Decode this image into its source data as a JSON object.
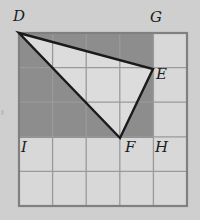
{
  "figure": {
    "background_color": "#cfcfcf",
    "grid": {
      "columns": 5,
      "rows": 5,
      "left": 19,
      "top": 33,
      "right": 187,
      "bottom": 206,
      "cell_width": 33.6,
      "cell_height": 34.6,
      "inner_line_color": "#9a9a9a",
      "inner_line_width": 1.3,
      "outer_line_color": "#808080",
      "outer_line_width": 2.2,
      "cell_fill_color": "#d8d8d8"
    },
    "shaded_region": {
      "name": "rectangle-DGHI",
      "fill_color": "#8d8d8d",
      "x": 19,
      "y": 33,
      "width": 134,
      "height": 105,
      "columns_spanned": 4,
      "rows_spanned": 3
    },
    "triangle": {
      "name": "triangle-DEF",
      "fill_color": "#dcdcdc",
      "stroke_color": "#1a1a1a",
      "stroke_width": 2.4,
      "vertices": [
        {
          "label": "D",
          "x": 19,
          "y": 33
        },
        {
          "label": "E",
          "x": 153,
          "y": 69
        },
        {
          "label": "F",
          "x": 120,
          "y": 138
        }
      ]
    },
    "labels": [
      {
        "id": "label-d",
        "text": "D",
        "x": 13,
        "y": 9
      },
      {
        "id": "label-g",
        "text": "G",
        "x": 150,
        "y": 10
      },
      {
        "id": "label-e",
        "text": "E",
        "x": 156,
        "y": 67
      },
      {
        "id": "label-i",
        "text": "I",
        "x": 21,
        "y": 140
      },
      {
        "id": "label-f",
        "text": "F",
        "x": 125,
        "y": 140
      },
      {
        "id": "label-h",
        "text": "H",
        "x": 155,
        "y": 140
      }
    ]
  }
}
